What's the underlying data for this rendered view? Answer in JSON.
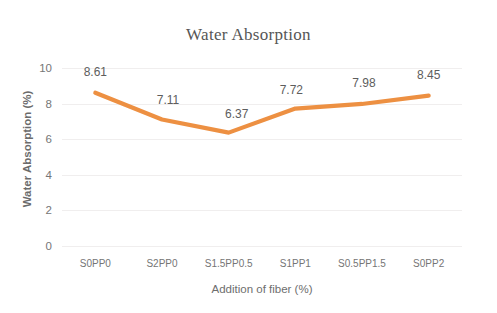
{
  "chart_data": {
    "type": "line",
    "title": "Water Absorption",
    "xlabel": "Addition of fiber (%)",
    "ylabel": "Water Absorption (%)",
    "categories": [
      "S0PP0",
      "S2PP0",
      "S1.5PP0.5",
      "S1PP1",
      "S0.5PP1.5",
      "S0PP2"
    ],
    "values": [
      8.61,
      7.11,
      6.37,
      7.72,
      7.98,
      8.45
    ],
    "data_labels": [
      "8.61",
      "7.11",
      "6.37",
      "7.72",
      "7.98",
      "8.45"
    ],
    "ylim": [
      0,
      10
    ],
    "y_ticks": [
      0,
      2,
      4,
      6,
      8,
      10
    ],
    "y_tick_labels": [
      "0",
      "2",
      "4",
      "6",
      "8",
      "10"
    ],
    "grid": "horizontal",
    "legend": "none",
    "series": [
      {
        "name": "Water Absorption",
        "color": "#ED9042",
        "values": [
          8.61,
          7.11,
          6.37,
          7.72,
          7.98,
          8.45
        ]
      }
    ],
    "colors": {
      "line": "#ED9042",
      "gridline": "#F0EEEE",
      "title_text": "#565656",
      "axis_text": "#757575",
      "background": "#FFFFFF"
    }
  }
}
